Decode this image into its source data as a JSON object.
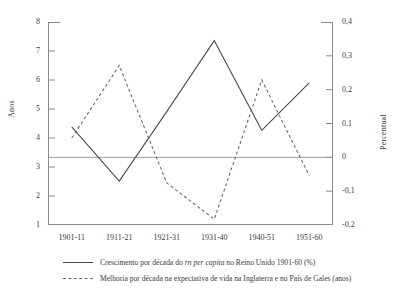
{
  "chart_data": {
    "type": "line",
    "title": "",
    "xlabel": "",
    "categories": [
      "1901-11",
      "1911-21",
      "1921-31",
      "1931-40",
      "1940-51",
      "1951-60"
    ],
    "grid": false,
    "legend_position": "bottom-left",
    "axes": {
      "left": {
        "label": "Anos",
        "ticks": [
          "1",
          "2",
          "3",
          "4",
          "5",
          "6",
          "7",
          "8"
        ],
        "values": [
          1,
          2,
          3,
          4,
          5,
          6,
          7,
          8
        ],
        "lim": [
          1,
          8
        ]
      },
      "right": {
        "label": "Percentual",
        "ticks": [
          "-0,2",
          "-0,1",
          "0",
          "0,1",
          "0,2",
          "0,3",
          "0,4"
        ],
        "values": [
          -0.2,
          -0.1,
          0,
          0.1,
          0.2,
          0.3,
          0.4
        ],
        "lim": [
          -0.2,
          0.4
        ]
      }
    },
    "zero_reference_line": 0,
    "series": [
      {
        "name": "Crescimento por década do rn per capita no Reino Unido 1901-60 (%)",
        "style": "solid",
        "color": "#4a4a4a",
        "axis": "right",
        "values": [
          0.09,
          -0.07,
          0.135,
          0.345,
          0.08,
          0.22
        ],
        "left_axis_equivalent": [
          4.0,
          1.95,
          4.6,
          7.35,
          4.25,
          5.95
        ]
      },
      {
        "name": "Melhoria por década na expectativa de vida na Inglaterra e no País de Gales (anos)",
        "style": "dashed",
        "color": "#6a6a6a",
        "axis": "left",
        "values": [
          4.0,
          6.5,
          2.45,
          1.2,
          6.0,
          2.7
        ]
      }
    ]
  },
  "legend": {
    "items": [
      {
        "swatch": "solid-line-swatch",
        "text_before": "Crescimento por década do ",
        "text_italic": "rn per capita",
        "text_after": " no Reino Unido 1901-60 (%)"
      },
      {
        "swatch": "dashed-line-swatch",
        "text_before": "Melhoria por década na expectativa de vida na Inglaterra e no País de Gales (anos)",
        "text_italic": "",
        "text_after": ""
      }
    ]
  }
}
